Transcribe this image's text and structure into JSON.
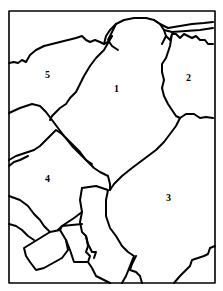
{
  "map": {
    "stroke_color": "#000000",
    "background_color": "#ffffff",
    "regions": [
      {
        "id": "1",
        "label": "1",
        "x": 114,
        "y": 84
      },
      {
        "id": "2",
        "label": "2",
        "x": 186,
        "y": 73
      },
      {
        "id": "3",
        "label": "3",
        "x": 166,
        "y": 193
      },
      {
        "id": "4",
        "label": "4",
        "x": 45,
        "y": 174
      },
      {
        "id": "5",
        "label": "5",
        "x": 45,
        "y": 70
      }
    ]
  }
}
